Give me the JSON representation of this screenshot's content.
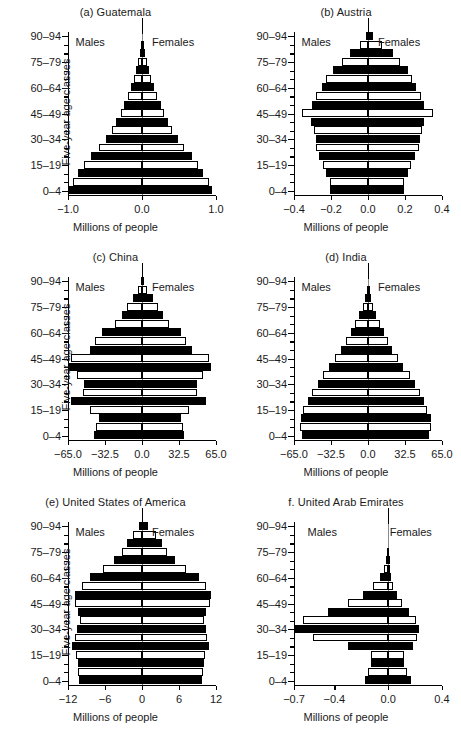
{
  "figure": {
    "axis_titles": {
      "x": "Millions of people",
      "y": "Five-year age classes"
    },
    "series_labels": {
      "males": "Males",
      "females": "Females"
    },
    "age_classes": [
      "0–4",
      "5–9",
      "10–14",
      "15–19",
      "20–24",
      "25–29",
      "30–34",
      "35–39",
      "40–44",
      "45–49",
      "50–54",
      "55–59",
      "60–64",
      "65–69",
      "70–74",
      "75–79",
      "80–84",
      "85–89",
      "90–94"
    ],
    "y_tick_labels": [
      "0–4",
      "15–19",
      "30–34",
      "45–49",
      "60–64",
      "75–79",
      "90–94"
    ],
    "colors": {
      "bar_fill": "#000000",
      "bar_open": "#ffffff",
      "axis": "#000000",
      "centerline": "#8a8a8a",
      "text": "#1a1a1a"
    }
  },
  "chart_data": [
    {
      "type": "bar",
      "panel": "a",
      "title": "(a) Guatemala",
      "xlabel": "Millions of people",
      "ylabel": "Five-year age classes",
      "xlim": [
        -1.0,
        1.0
      ],
      "x_tick_labels": [
        "−1.0",
        "0.0",
        "1.0"
      ],
      "x_tick_values": [
        -1.0,
        0.0,
        1.0
      ],
      "categories": [
        "0–4",
        "5–9",
        "10–14",
        "15–19",
        "20–24",
        "25–29",
        "30–34",
        "35–39",
        "40–44",
        "45–49",
        "50–54",
        "55–59",
        "60–64",
        "65–69",
        "70–74",
        "75–79",
        "80–84",
        "85–89",
        "90–94"
      ],
      "series": [
        {
          "name": "Males",
          "values": [
            0.98,
            0.93,
            0.86,
            0.79,
            0.69,
            0.58,
            0.49,
            0.41,
            0.35,
            0.29,
            0.24,
            0.19,
            0.15,
            0.11,
            0.08,
            0.055,
            0.033,
            0.016,
            0.006
          ]
        },
        {
          "name": "Females",
          "values": [
            0.95,
            0.9,
            0.83,
            0.76,
            0.67,
            0.57,
            0.48,
            0.41,
            0.35,
            0.3,
            0.25,
            0.2,
            0.16,
            0.12,
            0.09,
            0.062,
            0.038,
            0.019,
            0.007
          ]
        }
      ]
    },
    {
      "type": "bar",
      "panel": "b",
      "title": "(b) Austria",
      "xlabel": "Millions of people",
      "ylabel": "Five-year age classes",
      "xlim": [
        -0.4,
        0.4
      ],
      "x_tick_labels": [
        "−0.4",
        "−0.2",
        "0.0",
        "0.2",
        "0.4"
      ],
      "x_tick_values": [
        -0.4,
        -0.2,
        0.0,
        0.2,
        0.4
      ],
      "categories": [
        "0–4",
        "5–9",
        "10–14",
        "15–19",
        "20–24",
        "25–29",
        "30–34",
        "35–39",
        "40–44",
        "45–49",
        "50–54",
        "55–59",
        "60–64",
        "65–69",
        "70–74",
        "75–79",
        "80–84",
        "85–89",
        "90–94"
      ],
      "series": [
        {
          "name": "Males",
          "values": [
            0.205,
            0.205,
            0.225,
            0.245,
            0.265,
            0.28,
            0.28,
            0.29,
            0.31,
            0.355,
            0.305,
            0.28,
            0.25,
            0.225,
            0.19,
            0.14,
            0.095,
            0.045,
            0.013
          ]
        },
        {
          "name": "Females",
          "values": [
            0.195,
            0.195,
            0.215,
            0.235,
            0.255,
            0.275,
            0.28,
            0.29,
            0.305,
            0.35,
            0.305,
            0.285,
            0.26,
            0.24,
            0.215,
            0.175,
            0.135,
            0.075,
            0.028
          ]
        }
      ]
    },
    {
      "type": "bar",
      "panel": "c",
      "title": "(c) China",
      "xlabel": "Millions of people",
      "ylabel": "Five-year age classes",
      "xlim": [
        -65.0,
        65.0
      ],
      "x_tick_labels": [
        "−65.0",
        "−32.5",
        "0.0",
        "32.5",
        "65.0"
      ],
      "x_tick_values": [
        -65.0,
        -32.5,
        0.0,
        32.5,
        65.0
      ],
      "categories": [
        "0–4",
        "5–9",
        "10–14",
        "15–19",
        "20–24",
        "25–29",
        "30–34",
        "35–39",
        "40–44",
        "45–49",
        "50–54",
        "55–59",
        "60–64",
        "65–69",
        "70–74",
        "75–79",
        "80–84",
        "85–89",
        "90–94"
      ],
      "series": [
        {
          "name": "Males",
          "values": [
            42.0,
            40.5,
            38.0,
            46.0,
            62.0,
            52.0,
            51.0,
            57.0,
            64.0,
            62.0,
            46.0,
            41.0,
            35.0,
            24.0,
            18.0,
            13.0,
            8.0,
            3.4,
            1.0
          ]
        },
        {
          "name": "Females",
          "values": [
            37.0,
            36.0,
            34.0,
            41.0,
            56.0,
            48.0,
            48.0,
            54.0,
            61.0,
            59.0,
            44.0,
            39.0,
            34.0,
            24.0,
            18.5,
            14.0,
            9.5,
            4.6,
            1.6
          ]
        }
      ]
    },
    {
      "type": "bar",
      "panel": "d",
      "title": "(d) India",
      "xlabel": "Millions of people",
      "ylabel": "Five-year age classes",
      "xlim": [
        -65.0,
        65.0
      ],
      "x_tick_labels": [
        "−65.0",
        "−32.5",
        "0.0",
        "32.5",
        "65.0"
      ],
      "x_tick_values": [
        -65.0,
        -32.5,
        0.0,
        32.5,
        65.0
      ],
      "categories": [
        "0–4",
        "5–9",
        "10–14",
        "15–19",
        "20–24",
        "25–29",
        "30–34",
        "35–39",
        "40–44",
        "45–49",
        "50–54",
        "55–59",
        "60–64",
        "65–69",
        "70–74",
        "75–79",
        "80–84",
        "85–89",
        "90–94"
      ],
      "series": [
        {
          "name": "Males",
          "values": [
            58.0,
            59.5,
            59.0,
            57.0,
            53.0,
            49.0,
            44.0,
            39.5,
            34.0,
            29.0,
            24.0,
            19.0,
            15.0,
            11.0,
            7.5,
            4.6,
            2.4,
            0.9,
            0.25
          ]
        },
        {
          "name": "Females",
          "values": [
            54.0,
            55.5,
            55.0,
            52.0,
            49.0,
            45.5,
            41.0,
            36.5,
            31.0,
            26.0,
            21.5,
            17.5,
            14.0,
            10.5,
            7.3,
            4.6,
            2.5,
            1.0,
            0.3
          ]
        }
      ]
    },
    {
      "type": "bar",
      "panel": "e",
      "title": "(e) United States of America",
      "xlabel": "Millions of people",
      "ylabel": "Five-year age classes",
      "xlim": [
        -12,
        12
      ],
      "x_tick_labels": [
        "−12",
        "−6",
        "0",
        "6",
        "12"
      ],
      "x_tick_values": [
        -12,
        -6,
        0,
        6,
        12
      ],
      "categories": [
        "0–4",
        "5–9",
        "10–14",
        "15–19",
        "20–24",
        "25–29",
        "30–34",
        "35–39",
        "40–44",
        "45–49",
        "50–54",
        "55–59",
        "60–64",
        "65–69",
        "70–74",
        "75–79",
        "80–84",
        "85–89",
        "90–94"
      ],
      "series": [
        {
          "name": "Males",
          "values": [
            10.2,
            10.3,
            10.4,
            10.7,
            11.3,
            10.9,
            10.5,
            10.1,
            10.3,
            10.9,
            10.8,
            9.8,
            8.5,
            6.4,
            4.6,
            3.3,
            2.4,
            1.4,
            0.55
          ]
        },
        {
          "name": "Females",
          "values": [
            9.8,
            9.9,
            10.0,
            10.2,
            10.8,
            10.6,
            10.4,
            10.1,
            10.4,
            11.1,
            11.2,
            10.4,
            9.2,
            7.2,
            5.4,
            4.1,
            3.3,
            2.2,
            1.05
          ]
        }
      ]
    },
    {
      "type": "bar",
      "panel": "f",
      "title": "f. United Arab Emirates",
      "xlabel": "Millions of people",
      "ylabel": "Five-year age classes",
      "xlim": [
        -0.7,
        0.4
      ],
      "x_tick_labels": [
        "−0.7",
        "−0.4",
        "0.0",
        "0.4"
      ],
      "x_tick_values": [
        -0.7,
        -0.4,
        0.0,
        0.4
      ],
      "categories": [
        "0–4",
        "5–9",
        "10–14",
        "15–19",
        "20–24",
        "25–29",
        "30–34",
        "35–39",
        "40–44",
        "45–49",
        "50–54",
        "55–59",
        "60–64",
        "65–69",
        "70–74",
        "75–79",
        "80–84",
        "85–89",
        "90–94"
      ],
      "series": [
        {
          "name": "Males",
          "values": [
            0.175,
            0.15,
            0.128,
            0.126,
            0.3,
            0.56,
            0.7,
            0.63,
            0.45,
            0.3,
            0.185,
            0.11,
            0.06,
            0.03,
            0.015,
            0.008,
            0.004,
            0.0015,
            0.0005
          ]
        },
        {
          "name": "Females",
          "values": [
            0.168,
            0.143,
            0.12,
            0.118,
            0.185,
            0.215,
            0.23,
            0.205,
            0.155,
            0.105,
            0.065,
            0.038,
            0.022,
            0.012,
            0.007,
            0.004,
            0.002,
            0.0008,
            0.0003
          ]
        }
      ]
    }
  ]
}
